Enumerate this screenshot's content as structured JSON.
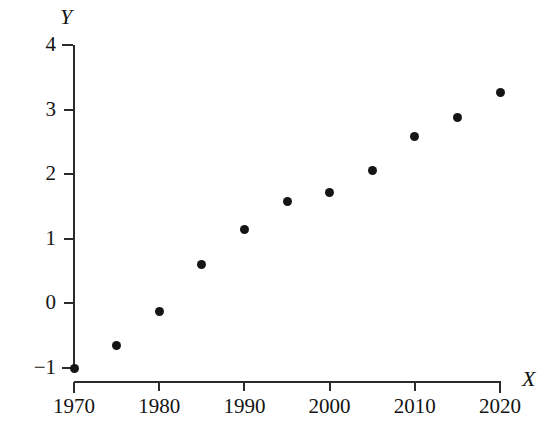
{
  "chart_data": {
    "type": "scatter",
    "title": "",
    "xlabel": "X",
    "ylabel": "Y",
    "x": [
      1970,
      1975,
      1980,
      1985,
      1990,
      1995,
      2000,
      2005,
      2010,
      2015,
      2020
    ],
    "values": [
      -1.0,
      -0.65,
      -0.12,
      0.6,
      1.15,
      1.58,
      1.72,
      2.05,
      2.58,
      2.87,
      3.27
    ],
    "series": [
      {
        "name": "Y",
        "values": [
          -1.0,
          -0.65,
          -0.12,
          0.6,
          1.15,
          1.58,
          1.72,
          2.05,
          2.58,
          2.87,
          3.27
        ]
      }
    ],
    "xlim": [
      1970,
      2020
    ],
    "ylim": [
      -1,
      4
    ],
    "xticks": [
      1970,
      1980,
      1990,
      2000,
      2010,
      2020
    ],
    "xtick_labels": [
      "1970",
      "1980",
      "1990",
      "2000",
      "2010",
      "2020"
    ],
    "yticks": [
      -1,
      0,
      1,
      2,
      3,
      4
    ],
    "ytick_labels": [
      "−1",
      "0",
      "1",
      "2",
      "3",
      "4"
    ],
    "grid": false,
    "legend": false,
    "legend_position": "none",
    "marker": "filled-circle",
    "marker_color": "#151515",
    "axis_color": "#2b2b2b",
    "background_color": "#ffffff"
  },
  "axes": {
    "y_name": "Y",
    "x_name": "X"
  }
}
